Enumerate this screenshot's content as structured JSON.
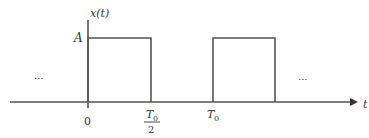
{
  "diagram": {
    "type": "periodic rectangular pulse train",
    "y_axis_label": "x(t)",
    "x_axis_label": "t",
    "amplitude_label": "A",
    "ticks": {
      "origin": "0",
      "half_period_numerator": "T",
      "half_period_numerator_sub": "0",
      "half_period_denominator": "2",
      "period": "T",
      "period_sub": "0"
    },
    "ellipsis_left": "...",
    "ellipsis_right": "...",
    "pulses": [
      {
        "start": "0",
        "end": "T0/2",
        "height": "A"
      },
      {
        "start": "T0",
        "end": "3T0/2",
        "height": "A"
      }
    ],
    "colors": {
      "stroke": "#555555",
      "text": "#333333"
    }
  }
}
